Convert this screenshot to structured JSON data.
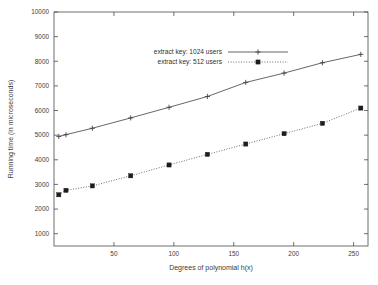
{
  "chart_data": {
    "type": "line",
    "title": "",
    "xlabel": "Degrees of polynomial h(x)",
    "ylabel": "Running time (in microseconds)",
    "xlim": [
      0,
      262
    ],
    "ylim": [
      500,
      10000
    ],
    "xticks": [
      50,
      100,
      150,
      200,
      250
    ],
    "yticks": [
      1000,
      2000,
      3000,
      4000,
      5000,
      6000,
      7000,
      8000,
      9000,
      10000
    ],
    "xtick_labels": [
      "50",
      "100",
      "150",
      "200",
      "250"
    ],
    "ytick_labels": [
      "1000",
      "2000",
      "3000",
      "4000",
      "5000",
      "6000",
      "7000",
      "8000",
      "9000",
      "10000"
    ],
    "grid": false,
    "legend_position": "upper-center",
    "x": [
      4,
      10,
      32,
      64,
      96,
      128,
      160,
      192,
      224,
      256
    ],
    "series": [
      {
        "name": "extract key: 1024 users",
        "marker": "plus",
        "linestyle": "solid",
        "color": "#4a4a4a",
        "values": [
          4950,
          5020,
          5280,
          5700,
          6130,
          6570,
          7140,
          7520,
          7940,
          8280
        ]
      },
      {
        "name": "extract key: 512 users",
        "marker": "filled-square",
        "linestyle": "dotted",
        "color": "#555555",
        "values": [
          2580,
          2760,
          2940,
          3350,
          3790,
          4220,
          4640,
          5060,
          5480,
          6100
        ]
      }
    ]
  },
  "legend": {
    "entries": [
      {
        "label": "extract key: 1024 users"
      },
      {
        "label": "extract key: 512 users"
      }
    ]
  },
  "axes": {
    "x_title": "Degrees of polynomial h(x)",
    "y_title": "Running time (in microseconds)"
  }
}
